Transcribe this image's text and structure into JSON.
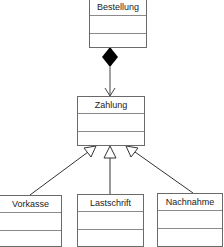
{
  "diagram": {
    "type": "uml-class-diagram",
    "classes": [
      {
        "id": "bestellung",
        "name": "Bestellung"
      },
      {
        "id": "zahlung",
        "name": "Zahlung"
      },
      {
        "id": "vorkasse",
        "name": "Vorkasse"
      },
      {
        "id": "lastschrift",
        "name": "Lastschrift"
      },
      {
        "id": "nachnahme",
        "name": "Nachnahme"
      }
    ],
    "relations": [
      {
        "type": "composition",
        "from": "Bestellung",
        "to": "Zahlung"
      },
      {
        "type": "generalization",
        "from": "Vorkasse",
        "to": "Zahlung"
      },
      {
        "type": "generalization",
        "from": "Lastschrift",
        "to": "Zahlung"
      },
      {
        "type": "generalization",
        "from": "Nachnahme",
        "to": "Zahlung"
      }
    ]
  },
  "colors": {
    "line": "#333333",
    "border": "#6a6a6a",
    "diamond": "#000000"
  }
}
